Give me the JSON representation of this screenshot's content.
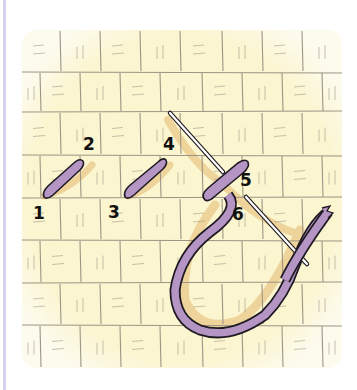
{
  "figure": {
    "colors": {
      "fabric": "#fbf5d0",
      "fabric_edge": "#fdf9e6",
      "weave_line": "#9c9585",
      "thread": "#b495c4",
      "thread_outline": "#1f1a22",
      "shadow": "#eac98a",
      "needle": "#ffffff",
      "side_bar": "#d4d2ec"
    },
    "labels": [
      "1",
      "2",
      "3",
      "4",
      "5",
      "6"
    ],
    "elements": {
      "stitch_1_2": "completed stitch from point 1 to point 2",
      "stitch_3_4": "completed stitch from point 3 to point 4",
      "stitch_5": "stitch in progress at point 5",
      "needle": "needle entering at 5 and emerging at 6",
      "thread_loop": "working thread loop"
    }
  }
}
